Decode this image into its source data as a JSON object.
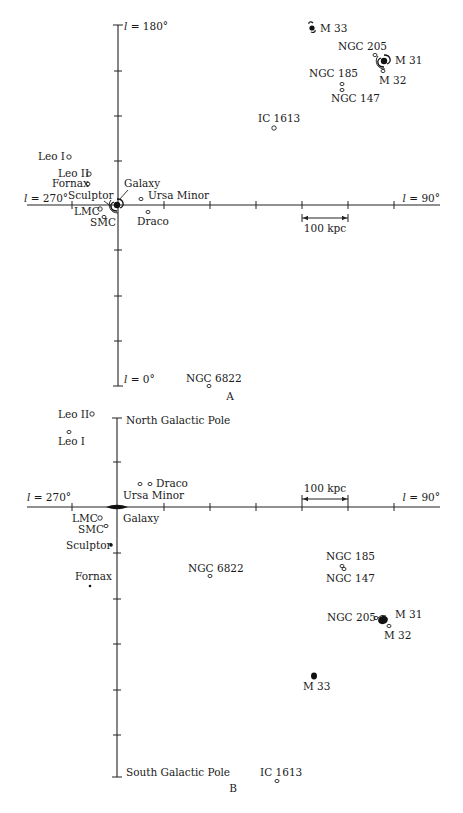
{
  "panels": [
    {
      "id": "A",
      "caption": "A",
      "caption_pos": [
        230,
        400
      ],
      "axis_labels": {
        "top": "l = 180°",
        "left": "l = 270°",
        "right": "l = 90°",
        "bottom": "l = 0°"
      },
      "scale_bar": {
        "label": "100 kpc",
        "x1": 302,
        "x2": 348,
        "y": 218,
        "label_y": 232
      },
      "galaxies": [
        {
          "name": "Galaxy",
          "x": 117,
          "y": 205,
          "shape": "spiral",
          "label_x": 124,
          "label_y": 187,
          "pointer": true
        },
        {
          "name": "Leo I",
          "x": 69,
          "y": 157,
          "shape": "ring",
          "label_x": 38,
          "label_y": 160
        },
        {
          "name": "Leo II",
          "x": 89,
          "y": 174,
          "shape": "ring",
          "label_x": 58,
          "label_y": 177
        },
        {
          "name": "Fornax",
          "x": 88,
          "y": 184,
          "shape": "ring-small",
          "label_x": 52,
          "label_y": 187
        },
        {
          "name": "Sculptor",
          "x": 112,
          "y": 205,
          "shape": "none",
          "label_x": 68,
          "label_y": 199
        },
        {
          "name": "LMC",
          "x": 100,
          "y": 209,
          "shape": "ring",
          "label_x": 74,
          "label_y": 215
        },
        {
          "name": "SMC",
          "x": 104,
          "y": 217,
          "shape": "ring-small",
          "label_x": 90,
          "label_y": 226
        },
        {
          "name": "Ursa Minor",
          "x": 141,
          "y": 199,
          "shape": "ring-small",
          "label_x": 148,
          "label_y": 199
        },
        {
          "name": "Draco",
          "x": 148,
          "y": 212,
          "shape": "ring-small",
          "label_x": 137,
          "label_y": 225
        },
        {
          "name": "IC 1613",
          "x": 274,
          "y": 128,
          "shape": "ring",
          "label_x": 258,
          "label_y": 122
        },
        {
          "name": "M 33",
          "x": 312,
          "y": 27,
          "shape": "spiral-small",
          "label_x": 320,
          "label_y": 32
        },
        {
          "name": "NGC 205",
          "x": 375,
          "y": 55,
          "shape": "ring-small",
          "label_x": 338,
          "label_y": 50
        },
        {
          "name": "M 31",
          "x": 384,
          "y": 61,
          "shape": "spiral",
          "label_x": 395,
          "label_y": 64
        },
        {
          "name": "M 32",
          "x": 383,
          "y": 71,
          "shape": "ring-small",
          "label_x": 379,
          "label_y": 84
        },
        {
          "name": "NGC 185",
          "x": 342,
          "y": 84,
          "shape": "ring-small",
          "label_x": 309,
          "label_y": 77
        },
        {
          "name": "NGC 147",
          "x": 342,
          "y": 90,
          "shape": "ring-small",
          "label_x": 331,
          "label_y": 102
        },
        {
          "name": "NGC 6822",
          "x": 209,
          "y": 386,
          "shape": "ring-small",
          "label_x": 186,
          "label_y": 382
        }
      ]
    },
    {
      "id": "B",
      "caption": "B",
      "caption_pos": [
        233,
        792
      ],
      "axis_labels": {
        "top": "North Galactic Pole",
        "left": "l = 270°",
        "right": "l = 90°",
        "bottom": "South Galactic Pole"
      },
      "scale_bar": {
        "label": "100 kpc",
        "x1": 302,
        "x2": 348,
        "y": 499,
        "label_y": 492
      },
      "galaxies": [
        {
          "name": "Galaxy",
          "x": 117,
          "y": 507,
          "shape": "disk",
          "label_x": 123,
          "label_y": 522
        },
        {
          "name": "Leo II",
          "x": 92,
          "y": 414,
          "shape": "ring",
          "label_x": 58,
          "label_y": 418
        },
        {
          "name": "Leo I",
          "x": 69,
          "y": 432,
          "shape": "ring-small",
          "label_x": 58,
          "label_y": 445
        },
        {
          "name": "Ursa Minor",
          "x": 140,
          "y": 484,
          "shape": "ring-small",
          "label_x": 123,
          "label_y": 499
        },
        {
          "name": "Draco",
          "x": 150,
          "y": 484,
          "shape": "ring-small",
          "label_x": 156,
          "label_y": 487
        },
        {
          "name": "LMC",
          "x": 100,
          "y": 518,
          "shape": "ring",
          "label_x": 72,
          "label_y": 522
        },
        {
          "name": "SMC",
          "x": 106,
          "y": 526,
          "shape": "ring-small",
          "label_x": 78,
          "label_y": 533
        },
        {
          "name": "Sculptor",
          "x": 111,
          "y": 545,
          "shape": "dot",
          "label_x": 66,
          "label_y": 549
        },
        {
          "name": "Fornax",
          "x": 90,
          "y": 586,
          "shape": "dot-small",
          "label_x": 75,
          "label_y": 580
        },
        {
          "name": "NGC 6822",
          "x": 210,
          "y": 576,
          "shape": "ring-small",
          "label_x": 188,
          "label_y": 572
        },
        {
          "name": "NGC 185",
          "x": 342,
          "y": 566,
          "shape": "ring-small",
          "label_x": 326,
          "label_y": 560
        },
        {
          "name": "NGC 147",
          "x": 344,
          "y": 569,
          "shape": "ring-small",
          "label_x": 326,
          "label_y": 582
        },
        {
          "name": "NGC 205",
          "x": 376,
          "y": 618,
          "shape": "ring-small",
          "label_x": 327,
          "label_y": 621
        },
        {
          "name": "M 31",
          "x": 383,
          "y": 620,
          "shape": "blob",
          "label_x": 395,
          "label_y": 618
        },
        {
          "name": "M 32",
          "x": 389,
          "y": 626,
          "shape": "ring-small",
          "label_x": 384,
          "label_y": 639
        },
        {
          "name": "M 33",
          "x": 314,
          "y": 676,
          "shape": "blob-small",
          "label_x": 303,
          "label_y": 690
        },
        {
          "name": "IC 1613",
          "x": 277,
          "y": 781,
          "shape": "ring-small",
          "label_x": 260,
          "label_y": 776
        }
      ]
    }
  ],
  "geometry": {
    "A": {
      "vx": 118,
      "vtop": 25,
      "vbot": 386,
      "hy": 205,
      "hleft": 27,
      "hright": 440,
      "vticks": [
        71,
        116,
        161,
        250,
        296,
        341
      ],
      "hticks": [
        72,
        164,
        210,
        256,
        302,
        348,
        394
      ]
    },
    "B": {
      "vx": 117,
      "vtop": 418,
      "vbot": 777,
      "hy": 507,
      "hleft": 27,
      "hright": 440,
      "vticks": [
        462,
        553,
        599,
        644,
        690,
        735
      ],
      "hticks": [
        72,
        164,
        210,
        256,
        302,
        348,
        394
      ]
    }
  }
}
